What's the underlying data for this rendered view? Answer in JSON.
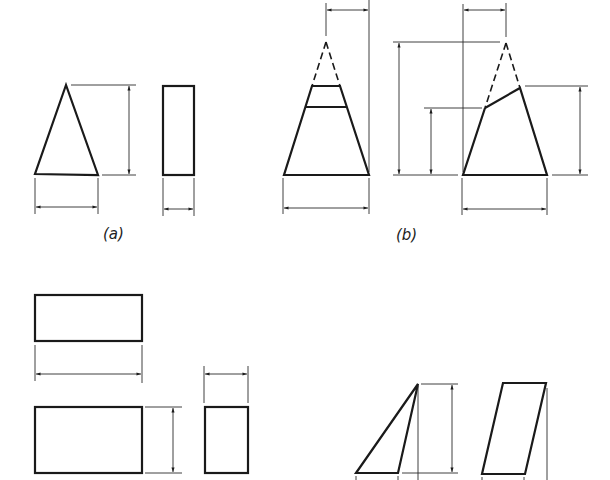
{
  "figure": {
    "colors": {
      "line": "#1a1a1a",
      "background": "#ffffff"
    },
    "panels": [
      {
        "id": "a",
        "label": "(a)",
        "shapes": [
          "triangle front view",
          "rectangle side view"
        ],
        "dimensions": [
          "triangle height",
          "triangle base width",
          "rectangle width"
        ]
      },
      {
        "id": "b",
        "label": "(b)",
        "shapes": [
          "truncated cone front view",
          "obliquely truncated cone front view"
        ],
        "dimensions": [
          "top offset",
          "base width",
          "apex height",
          "left cut height",
          "right cut height",
          "apex offset",
          "base width"
        ]
      },
      {
        "id": "c",
        "label": "",
        "shapes": [
          "top view rectangle",
          "front view rectangle",
          "side view rectangle"
        ],
        "dimensions": [
          "length",
          "height",
          "depth"
        ]
      },
      {
        "id": "d",
        "label": "",
        "shapes": [
          "triangle view",
          "parallelogram view"
        ],
        "dimensions": [
          "height"
        ]
      }
    ]
  }
}
